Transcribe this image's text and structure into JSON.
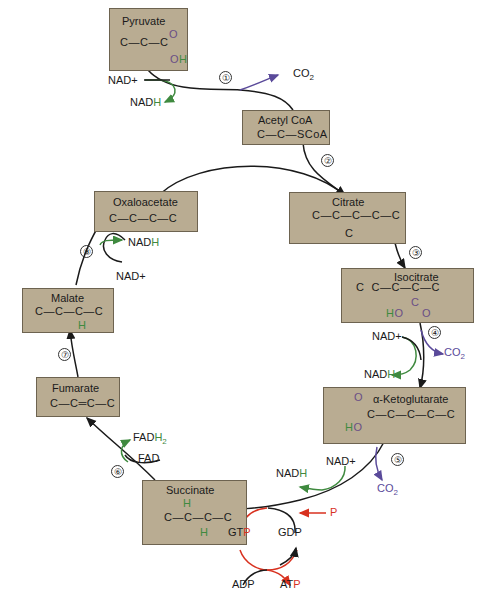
{
  "colors": {
    "box_fill": "#b9ac92",
    "line": "#1a1a1a",
    "nadh_green": "#3f8a3f",
    "co2_purple": "#5a4a9a",
    "atp_red": "#d8311f"
  },
  "compounds": {
    "pyruvate": {
      "name": "Pyruvate",
      "formula": "C—C—C",
      "o": "O",
      "oh_o": "O",
      "oh_h": "H"
    },
    "acetyl_coa": {
      "name": "Acetyl CoA",
      "formula": "C—C—SCoA"
    },
    "citrate": {
      "name": "Citrate",
      "formula": "C—C—C—C—C",
      "branch": "C"
    },
    "isocitrate": {
      "name": "Isocitrate",
      "formula": "C  C—C—C—C",
      "c": "C",
      "ho_h": "H",
      "ho_o": "O",
      "o": "O"
    },
    "alpha_ketoglutarate": {
      "name": "α-Ketoglutarate",
      "formula": "C—C—C—C—C",
      "o": "O",
      "ho_h": "H",
      "ho_o": "O"
    },
    "succinate": {
      "name": "Succinate",
      "formula": "C—C—C—C",
      "h_top": "H",
      "h_bottom": "H"
    },
    "fumarate": {
      "name": "Fumarate",
      "formula": "C—C═C—C"
    },
    "malate": {
      "name": "Malate",
      "formula": "C—C—C—C",
      "h": "H"
    },
    "oxaloacetate": {
      "name": "Oxaloacetate",
      "formula": "C—C—C—C"
    }
  },
  "steps": [
    "①",
    "②",
    "③",
    "④",
    "⑤",
    "⑥",
    "⑦",
    "⑧"
  ],
  "cofactors": {
    "s1_nad": "NAD+",
    "s1_nadh": "NAD",
    "s1_nadh_h": "H",
    "s1_co2": "CO",
    "s1_co2_sub": "2",
    "s4_nad": "NAD+",
    "s4_nadh": "NAD",
    "s4_nadh_h": "H",
    "s4_co2": "CO",
    "s4_co2_sub": "2",
    "s5_nad": "NAD+",
    "s5_nadh": "NAD",
    "s5_nadh_h": "H",
    "s5_co2": "CO",
    "s5_co2_sub": "2",
    "s6_fad": "FAD",
    "s6_fadh": "FAD",
    "s6_fadh_h": "H",
    "s6_fadh_sub": "2",
    "s8_nad": "NAD+",
    "s8_nadh": "NAD",
    "s8_nadh_h": "H",
    "gtp": "GT",
    "gtp_p": "P",
    "gdp": "GDP",
    "p": "P",
    "adp": "ADP",
    "atp": "AT",
    "atp_p": "P"
  }
}
